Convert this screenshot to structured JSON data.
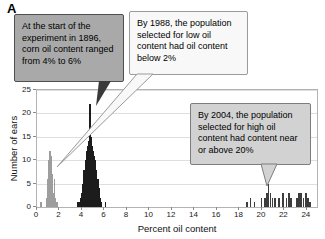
{
  "figure_label": "A",
  "annotations": {
    "start_1896": "At the start of the experiment in 1896, corn oil content ranged from 4% to 6%",
    "low_1988": "By 1988, the population selected for low oil content had oil content below 2%",
    "high_2004": "By 2004, the population selected for high oil content had content near or above 20%"
  },
  "colors": {
    "population_1896": "#1c1c1c",
    "population_1988_low": "#9d9d9d",
    "population_2004_high": "#3d3d3d",
    "callout_1896_bg": "#a9a9a9",
    "callout_1988_bg": "#f8f8f8",
    "callout_2004_bg": "#d2d2d2",
    "gridline": "#dedede"
  },
  "chart_data": {
    "type": "bar",
    "title": "",
    "xlabel": "Percent oil content",
    "ylabel": "Number of ears",
    "xlim": [
      0,
      24.9
    ],
    "ylim": [
      0,
      25
    ],
    "xticks": [
      0,
      2,
      4,
      6,
      8,
      10,
      12,
      14,
      16,
      18,
      20,
      22,
      24
    ],
    "yticks": [
      0,
      5,
      10,
      15,
      20,
      25
    ],
    "grid": true,
    "legend": "none",
    "series": [
      {
        "name": "1896 starting population (4-6% oil)",
        "color": "#1c1c1c",
        "points": [
          [
            3.6,
            1
          ],
          [
            3.75,
            1
          ],
          [
            3.9,
            2
          ],
          [
            4.0,
            3
          ],
          [
            4.1,
            5
          ],
          [
            4.2,
            8
          ],
          [
            4.3,
            10
          ],
          [
            4.4,
            12
          ],
          [
            4.5,
            13
          ],
          [
            4.6,
            14
          ],
          [
            4.7,
            22
          ],
          [
            4.8,
            15
          ],
          [
            4.9,
            13
          ],
          [
            5.0,
            12
          ],
          [
            5.1,
            11
          ],
          [
            5.2,
            10
          ],
          [
            5.3,
            8
          ],
          [
            5.4,
            6
          ],
          [
            5.5,
            4
          ],
          [
            5.6,
            2
          ],
          [
            5.75,
            1
          ],
          [
            6.1,
            1
          ]
        ]
      },
      {
        "name": "1988 population selected for low oil content (below 2%)",
        "color": "#9d9d9d",
        "points": [
          [
            0.35,
            1
          ],
          [
            0.85,
            2
          ],
          [
            0.95,
            6
          ],
          [
            1.05,
            10
          ],
          [
            1.15,
            12
          ],
          [
            1.25,
            11
          ],
          [
            1.35,
            7
          ],
          [
            1.45,
            3
          ],
          [
            1.55,
            6
          ],
          [
            1.65,
            2
          ],
          [
            1.8,
            1
          ]
        ]
      },
      {
        "name": "2004 population selected for high oil content (near or above 20%)",
        "color": "#3d3d3d",
        "points": [
          [
            18.7,
            1
          ],
          [
            19.0,
            2
          ],
          [
            19.35,
            1
          ],
          [
            19.95,
            2
          ],
          [
            20.25,
            2
          ],
          [
            20.45,
            3
          ],
          [
            20.6,
            5
          ],
          [
            20.75,
            3
          ],
          [
            20.95,
            2
          ],
          [
            21.15,
            2
          ],
          [
            21.5,
            2
          ],
          [
            21.9,
            3
          ],
          [
            22.2,
            2
          ],
          [
            22.4,
            3
          ],
          [
            22.6,
            2
          ],
          [
            23.1,
            2
          ],
          [
            23.3,
            3
          ],
          [
            23.5,
            3
          ],
          [
            23.7,
            2
          ],
          [
            23.9,
            3
          ],
          [
            24.1,
            2
          ],
          [
            24.3,
            1
          ]
        ]
      }
    ]
  }
}
